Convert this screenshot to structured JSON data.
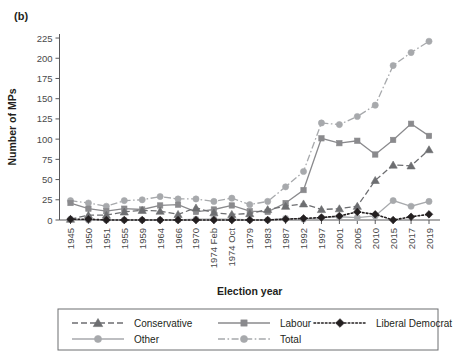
{
  "figure": {
    "panel_label": "(b)",
    "x_axis_title": "Election year",
    "y_axis_title": "Number of MPs"
  },
  "chart_data": {
    "type": "line",
    "title": "(b)",
    "xlabel": "Election year",
    "ylabel": "Number of MPs",
    "ylim": [
      0,
      230
    ],
    "yticks": [
      0,
      25,
      50,
      75,
      100,
      125,
      150,
      175,
      200,
      225
    ],
    "grid": false,
    "legend_position": "bottom",
    "categories": [
      "1945",
      "1950",
      "1951",
      "1955",
      "1959",
      "1964",
      "1966",
      "1970",
      "1974 Feb",
      "1974 Oct",
      "1979",
      "1983",
      "1987",
      "1992",
      "1997",
      "2001",
      "2005",
      "2010",
      "2015",
      "2017",
      "2019"
    ],
    "series": [
      {
        "name": "Conservative",
        "color": "#6d6e71",
        "marker": "triangle",
        "dash": "dashed",
        "values": [
          1,
          6,
          6,
          10,
          12,
          11,
          7,
          15,
          9,
          7,
          8,
          13,
          17,
          20,
          13,
          14,
          17,
          49,
          68,
          67,
          87
        ]
      },
      {
        "name": "Labour",
        "color": "#8a8a8d",
        "marker": "square",
        "dash": "solid",
        "values": [
          21,
          14,
          11,
          14,
          13,
          18,
          19,
          10,
          13,
          18,
          11,
          10,
          21,
          37,
          101,
          95,
          98,
          81,
          99,
          119,
          104
        ]
      },
      {
        "name": "Liberal Democrat",
        "color": "#231f20",
        "marker": "diamond",
        "dash": "dotted",
        "values": [
          1,
          1,
          0,
          0,
          0,
          0,
          0,
          0,
          0,
          0,
          0,
          0,
          1,
          2,
          3,
          5,
          10,
          7,
          0,
          4,
          7
        ]
      },
      {
        "name": "Other",
        "color": "#a7a9ac",
        "marker": "circle",
        "dash": "solid",
        "values": [
          1,
          0,
          0,
          0,
          0,
          0,
          0,
          1,
          1,
          1,
          0,
          0,
          2,
          1,
          3,
          4,
          3,
          5,
          24,
          17,
          23
        ]
      },
      {
        "name": "Total",
        "color": "#a7a9ac",
        "marker": "circle",
        "dash": "dashdot",
        "values": [
          24,
          21,
          17,
          24,
          25,
          29,
          26,
          26,
          23,
          27,
          19,
          23,
          41,
          60,
          120,
          118,
          128,
          142,
          191,
          207,
          221
        ]
      }
    ]
  },
  "legend": {
    "entries": [
      {
        "label": "Conservative"
      },
      {
        "label": "Labour"
      },
      {
        "label": "Liberal Democrat"
      },
      {
        "label": "Other"
      },
      {
        "label": "Total"
      }
    ]
  }
}
